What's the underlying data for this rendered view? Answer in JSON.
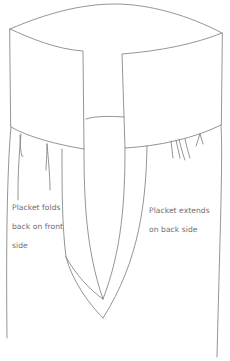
{
  "diagram": {
    "stroke_color": "#7a7a7a",
    "background": "#ffffff",
    "labels": {
      "front": {
        "line1": "Placket folds",
        "line2": "back on front",
        "line3": "side"
      },
      "back": {
        "line1": "Placket extends",
        "line2": "on back side"
      }
    },
    "parts": [
      "cuff-top-edge",
      "left-cuff-flap",
      "right-cuff-flap",
      "center-band",
      "placket-inner-v",
      "placket-outer-v",
      "sleeve-left-edge",
      "sleeve-right-edge",
      "gathers"
    ]
  }
}
